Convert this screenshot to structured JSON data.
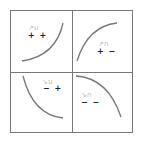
{
  "diagram": {
    "type": "sign-chart-2x2",
    "border_color": "#777777",
    "curve_color": "#777777",
    "cells": [
      {
        "position": "top-left",
        "signs": "+ +",
        "hint_glyph": "↗∪",
        "curve": "increasing-concave-up"
      },
      {
        "position": "top-right",
        "signs": "+ −",
        "hint_glyph": "↗∩",
        "curve": "increasing-concave-down"
      },
      {
        "position": "bottom-left",
        "signs": "− +",
        "hint_glyph": "↘∪",
        "curve": "decreasing-concave-up"
      },
      {
        "position": "bottom-right",
        "signs": "− −",
        "hint_glyph": "↘∩",
        "curve": "decreasing-concave-down"
      }
    ]
  }
}
